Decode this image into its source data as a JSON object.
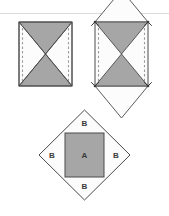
{
  "figure": {
    "background_color": "#ffffff",
    "rule_line_color": "#d8d8d8",
    "shaded_fill": "#a6a6a6",
    "unshaded_fill": "#fcfcfc",
    "outline_color": "#4a4a4a",
    "dashed_color": "#9a9a9a",
    "label_color": "#3a3a3a",
    "panels": [
      {
        "id": "panel-left",
        "name": "square-with-diagonals",
        "description": "Square divided by both diagonals into four triangles; top and bottom triangles shaded, left and right triangles unshaded; dashed vertical fold lines along the left and right sides.",
        "shaded_regions": [
          "top-triangle",
          "bottom-triangle"
        ],
        "unshaded_regions": [
          "left-triangle",
          "right-triangle"
        ],
        "dashed_edges": [
          "left-side",
          "right-side"
        ]
      },
      {
        "id": "panel-right",
        "name": "square-with-folded-out-triangles",
        "description": "Same square with the unshaded left and right triangles rotated outward about the dashed side lines so they point up and down, forming a hexagonal outline; the shaded triangles remain in place.",
        "shaded_regions": [
          "upper-shaded-triangle",
          "lower-shaded-triangle"
        ],
        "unshaded_regions": [
          "folded-up-triangle",
          "folded-down-triangle"
        ],
        "dashed_edges": [
          "left-side",
          "right-side"
        ],
        "markers": [
          "corner-arrowhead-top-left",
          "corner-arrowhead-top-right",
          "corner-arrowhead-bottom-left",
          "corner-arrowhead-bottom-right"
        ]
      },
      {
        "id": "panel-bottom",
        "name": "diamond-with-inscribed-square",
        "description": "A diamond (square rotated 45 degrees) containing a shaded upright square in the middle labelled A, with four unshaded corner triangle regions each labelled B.",
        "regions": [
          {
            "key": "center",
            "label": "A",
            "shaded": true
          },
          {
            "key": "top",
            "label": "B",
            "shaded": false
          },
          {
            "key": "right",
            "label": "B",
            "shaded": false
          },
          {
            "key": "bottom",
            "label": "B",
            "shaded": false
          },
          {
            "key": "left",
            "label": "B",
            "shaded": false
          }
        ]
      }
    ],
    "labels": {
      "center_a": "A",
      "top_b": "B",
      "right_b": "B",
      "bottom_b": "B",
      "left_b": "B"
    }
  }
}
